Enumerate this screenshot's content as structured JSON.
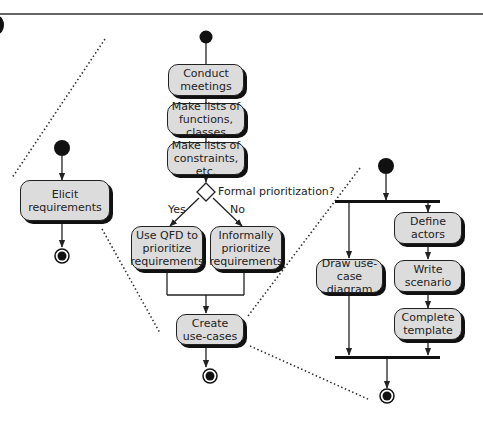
{
  "figure": {
    "panel_marker": "partial-circle",
    "colors": {
      "node_fill": "#dcdcdc",
      "stroke": "#222222",
      "shadow": "#111111",
      "top_rule": "#666666"
    }
  },
  "level1": {
    "activity": "Elicit requirements"
  },
  "level2": {
    "activities": {
      "conduct_meetings": "Conduct\nmeetings",
      "lists_functions": "Make lists of\nfunctions, classes",
      "lists_constraints": "Make lists of\nconstraints, etc.",
      "use_qfd": "Use QFD to\nprioritize\nrequirements",
      "informal": "Informally\nprioritize\nrequirements",
      "create_use_cases": "Create\nuse-cases"
    },
    "decision": {
      "question": "Formal prioritization?",
      "yes_label": "Yes",
      "no_label": "No"
    }
  },
  "level3": {
    "activities": {
      "draw_diagram": "Draw use-case\ndiagram",
      "define_actors": "Define\nactors",
      "write_scenario": "Write\nscenario",
      "complete_template": "Complete\ntemplate"
    }
  }
}
